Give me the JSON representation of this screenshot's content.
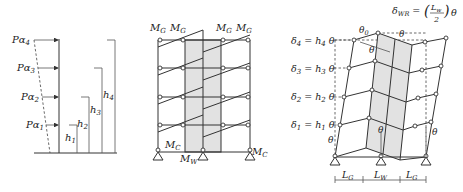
{
  "panels": {
    "loading": {
      "forces": [
        "Pα4",
        "Pα3",
        "Pα2",
        "Pα1"
      ],
      "force_base": "Pα",
      "force_subscripts": [
        "4",
        "3",
        "2",
        "1"
      ],
      "heights": [
        "h1",
        "h2",
        "h3",
        "h4"
      ],
      "height_base": "h",
      "height_subscripts": [
        "1",
        "2",
        "3",
        "4"
      ]
    },
    "mechanism": {
      "top_labels": [
        "MG",
        "MG",
        "MG",
        "MG"
      ],
      "moment_base": "M",
      "girder_sub": "G",
      "column_label_sub": "C",
      "wall_label_sub": "W",
      "labels": {
        "column_left": "MC",
        "wall": "MW",
        "column_right": "MC"
      }
    },
    "deformed": {
      "displacements": [
        {
          "lhs": "δ4",
          "rhs": "h4 θ",
          "d_sub": "4",
          "h_sub": "4"
        },
        {
          "lhs": "δ3",
          "rhs": "h3 θ",
          "d_sub": "3",
          "h_sub": "3"
        },
        {
          "lhs": "δ2",
          "rhs": "h2 θ",
          "d_sub": "2",
          "h_sub": "2"
        },
        {
          "lhs": "δ1",
          "rhs": "h1 θ",
          "d_sub": "1",
          "h_sub": "1"
        }
      ],
      "wall_uplift": "δWR = (Lw / 2) θ",
      "wall_uplift_parts": {
        "delta": "δ",
        "sub": "WR",
        "num": "L",
        "num_sub": "w",
        "den": "2",
        "theta": "θ"
      },
      "angle_labels": [
        "θ0",
        "θ",
        "θ",
        "θ",
        "θ",
        "θ"
      ],
      "theta": "θ",
      "theta0_sub": "0",
      "spans": [
        {
          "label": "LG",
          "base": "L",
          "sub": "G"
        },
        {
          "label": "LW",
          "base": "L",
          "sub": "W"
        },
        {
          "label": "LG",
          "base": "L",
          "sub": "G"
        }
      ]
    }
  }
}
